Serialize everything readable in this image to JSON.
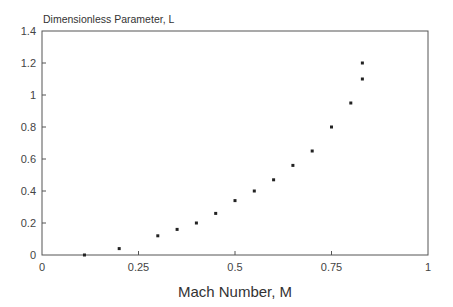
{
  "chart_data": {
    "type": "scatter",
    "title": "",
    "xlabel": "Mach Number, M",
    "ylabel": "Dimensionless Parameter, L",
    "xlim": [
      0,
      1
    ],
    "ylim": [
      0,
      1.4
    ],
    "xticks": [
      0,
      0.25,
      0.5,
      0.75,
      1
    ],
    "xtick_labels": [
      "0",
      "0.25",
      "0.5",
      "0.75",
      "1"
    ],
    "yticks": [
      0,
      0.2,
      0.4,
      0.6,
      0.8,
      1,
      1.2,
      1.4
    ],
    "ytick_labels": [
      "0",
      "0.2",
      "0.4",
      "0.6",
      "0.8",
      "1",
      "1.2",
      "1.4"
    ],
    "grid": false,
    "legend": null,
    "series": [
      {
        "name": "L",
        "marker": "square",
        "color": "#222222",
        "x": [
          0.11,
          0.2,
          0.3,
          0.35,
          0.4,
          0.45,
          0.5,
          0.55,
          0.6,
          0.65,
          0.7,
          0.75,
          0.8,
          0.83,
          0.83
        ],
        "y": [
          0.0,
          0.04,
          0.12,
          0.16,
          0.2,
          0.26,
          0.34,
          0.4,
          0.47,
          0.56,
          0.65,
          0.8,
          0.95,
          1.1,
          1.2
        ]
      }
    ]
  }
}
